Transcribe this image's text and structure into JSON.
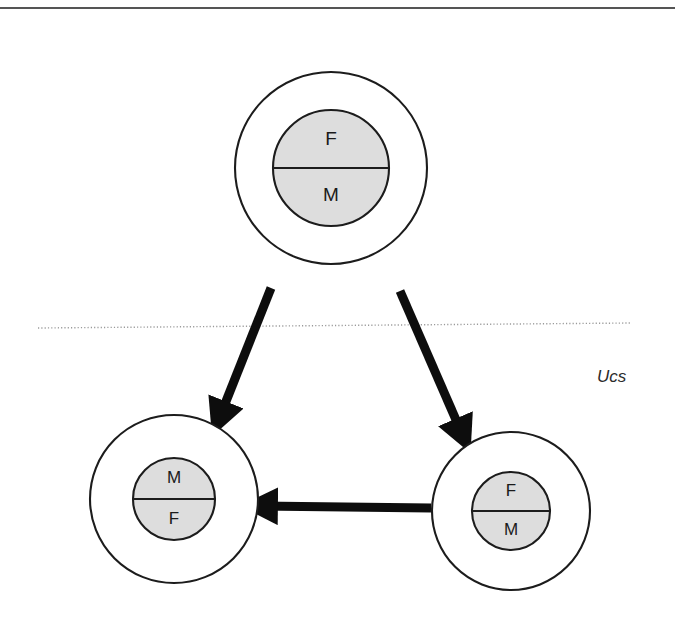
{
  "figure": {
    "background_color": "#ffffff"
  },
  "colors": {
    "outer_circle_fill": "#ffffff",
    "inner_circle_fill": "#dddddd",
    "stroke": "#1c1c1c",
    "arrow": "#0d0d0d",
    "dotted_line": "#9a9a9a",
    "top_rule": "#555555",
    "text": "#1a1a1a"
  },
  "frame": {
    "top_rule": {
      "x1": 0,
      "y1": 8,
      "x2": 675,
      "y2": 8
    }
  },
  "boundary": {
    "label": "Ucs",
    "label_x": 597,
    "label_y": 378,
    "dotted_line": {
      "x1": 38,
      "y1": 328,
      "x2": 632,
      "y2": 323
    }
  },
  "nodes": [
    {
      "id": "top",
      "name": "top-node",
      "cx": 331,
      "cy": 168,
      "outer_r": 96,
      "inner_r": 58,
      "upper_label": "F",
      "lower_label": "M",
      "label_size": "large"
    },
    {
      "id": "bottom-left",
      "name": "bottom-left-node",
      "cx": 174,
      "cy": 499,
      "outer_r": 84,
      "inner_r": 41,
      "upper_label": "M",
      "lower_label": "F",
      "label_size": "small"
    },
    {
      "id": "bottom-right",
      "name": "bottom-right-node",
      "cx": 511,
      "cy": 511,
      "outer_r": 79,
      "inner_r": 39,
      "upper_label": "F",
      "lower_label": "M",
      "label_size": "small"
    }
  ],
  "arrows": [
    {
      "id": "top-to-bottom-left",
      "name": "arrow-top-to-bottom-left",
      "from": "top",
      "to": "bottom-left",
      "x1": 271,
      "y1": 288,
      "x2": 219,
      "y2": 419
    },
    {
      "id": "top-to-bottom-right",
      "name": "arrow-top-to-bottom-right",
      "from": "top",
      "to": "bottom-right",
      "x1": 400,
      "y1": 291,
      "x2": 463,
      "y2": 436
    },
    {
      "id": "bottom-right-to-bottom-left",
      "name": "arrow-bottom-right-to-bottom-left",
      "from": "bottom-right",
      "to": "bottom-left",
      "x1": 431,
      "y1": 508,
      "x2": 259,
      "y2": 506
    }
  ]
}
